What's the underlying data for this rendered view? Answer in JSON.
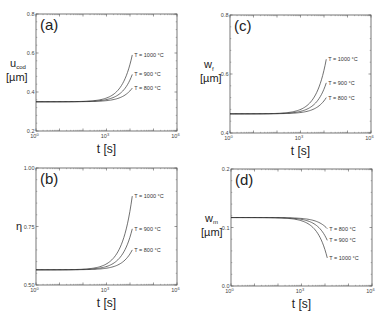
{
  "chart_data": [
    {
      "id": "a",
      "type": "line",
      "panel_label": "(a)",
      "ylabel": "u_cod [µm]",
      "ylabel_main": "u",
      "ylabel_sub": "cod",
      "ylabel_unit": "[µm]",
      "xlabel": "t [s]",
      "xscale": "log",
      "xlim": [
        1,
        1000000
      ],
      "xticks": [
        "10^0",
        "10^3",
        "10^6"
      ],
      "ylim": [
        0.2,
        0.8
      ],
      "yticks": [
        "0.2",
        "0.4",
        "0.6",
        "0.8"
      ],
      "baseline": 0.35,
      "t_end": 12500,
      "series": [
        {
          "name": "T = 1000 °C",
          "end": 0.59
        },
        {
          "name": "T = 900 °C",
          "end": 0.49
        },
        {
          "name": "T = 800 °C",
          "end": 0.42
        }
      ],
      "grid": false
    },
    {
      "id": "c",
      "type": "line",
      "panel_label": "(c)",
      "ylabel": "w_f [µm]",
      "ylabel_main": "w",
      "ylabel_sub": "f",
      "ylabel_unit": "[µm]",
      "xlabel": "t [s]",
      "xscale": "log",
      "xlim": [
        1,
        1000000
      ],
      "xticks": [
        "10^0",
        "10^3",
        "10^6"
      ],
      "ylim": [
        0.4,
        0.8
      ],
      "yticks": [
        "0.4",
        "0.6",
        "0.8"
      ],
      "baseline": 0.465,
      "t_end": 12500,
      "series": [
        {
          "name": "T = 1000 °C",
          "end": 0.65
        },
        {
          "name": "T = 900 °C",
          "end": 0.57
        },
        {
          "name": "T = 800 °C",
          "end": 0.52
        }
      ],
      "grid": false
    },
    {
      "id": "b",
      "type": "line",
      "panel_label": "(b)",
      "ylabel": "η",
      "ylabel_main": "η",
      "ylabel_sub": "",
      "ylabel_unit": "",
      "xlabel": "t [s]",
      "xscale": "log",
      "xlim": [
        1,
        1000000
      ],
      "xticks": [
        "10^0",
        "10^3",
        "10^6"
      ],
      "ylim": [
        0.5,
        1.0
      ],
      "yticks": [
        "0.50",
        "0.75",
        "1.00"
      ],
      "baseline": 0.565,
      "t_end": 12500,
      "series": [
        {
          "name": "T = 1000 °C",
          "end": 0.88
        },
        {
          "name": "T = 900 °C",
          "end": 0.74
        },
        {
          "name": "T = 800 °C",
          "end": 0.65
        }
      ],
      "grid": false
    },
    {
      "id": "d",
      "type": "line",
      "panel_label": "(d)",
      "ylabel": "w_m [µm]",
      "ylabel_main": "w",
      "ylabel_sub": "m",
      "ylabel_unit": "[µm]",
      "xlabel": "t [s]",
      "xscale": "log",
      "xlim": [
        1,
        1000000
      ],
      "xticks": [
        "10^0",
        "10^3",
        "10^6"
      ],
      "ylim": [
        0.0,
        0.2
      ],
      "yticks": [
        "0.0",
        "0.1",
        "0.2"
      ],
      "baseline": 0.117,
      "t_end": 12500,
      "series": [
        {
          "name": "T = 800 °C",
          "end": 0.098
        },
        {
          "name": "T = 900 °C",
          "end": 0.078
        },
        {
          "name": "T = 1000 °C",
          "end": 0.048
        }
      ],
      "grid": false
    }
  ],
  "layout": {
    "panels": {
      "a": {
        "x0": 36,
        "x1": 177,
        "y0": 14,
        "y1": 131
      },
      "c": {
        "x0": 230,
        "x1": 371,
        "y0": 15,
        "y1": 133
      },
      "b": {
        "x0": 36,
        "x1": 177,
        "y0": 168,
        "y1": 285
      },
      "d": {
        "x0": 231,
        "x1": 372,
        "y0": 169,
        "y1": 286
      }
    },
    "line_color": "#333333",
    "frame_color": "#555555"
  }
}
